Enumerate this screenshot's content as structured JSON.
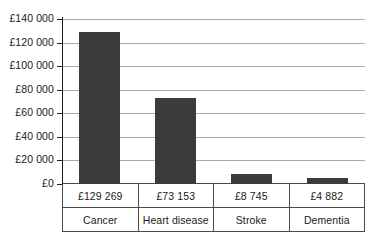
{
  "chart_data": {
    "type": "bar",
    "title": "",
    "xlabel": "",
    "ylabel": "",
    "categories": [
      "Cancer",
      "Heart disease",
      "Stroke",
      "Dementia"
    ],
    "values": [
      129269,
      73153,
      8745,
      4882
    ],
    "value_labels": [
      "£129 269",
      "£73 153",
      "£8 745",
      "£4 882"
    ],
    "ylim": [
      0,
      140000
    ],
    "ytick_values": [
      0,
      20000,
      40000,
      60000,
      80000,
      100000,
      120000,
      140000
    ],
    "ytick_labels": [
      "£0",
      "£20 000",
      "£40 000",
      "£60 000",
      "£80 000",
      "£100 000",
      "£120 000",
      "£140 000"
    ],
    "grid": true,
    "legend": false,
    "bar_color": "#3b3b3b",
    "gridline_color": "#a9a9a9",
    "axis_color": "#1c1c1c",
    "table_border_color": "#4a4a4a"
  }
}
